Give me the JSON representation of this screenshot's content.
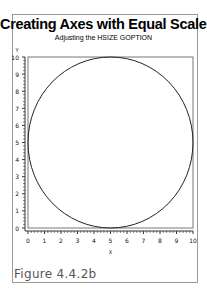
{
  "title": "Creating Axes with Equal Scales",
  "subtitle": "Adjusting the HSIZE GOPTION",
  "caption": "Figure 4.4.2b",
  "chart_data": {
    "type": "line",
    "title": "Creating Axes with Equal Scales",
    "subtitle": "Adjusting the HSIZE GOPTION",
    "xlabel": "X",
    "ylabel": "Y",
    "xlim": [
      0,
      10
    ],
    "ylim": [
      0,
      10
    ],
    "xticks": [
      0,
      1,
      2,
      3,
      4,
      5,
      6,
      7,
      8,
      9,
      10
    ],
    "yticks": [
      0,
      1,
      2,
      3,
      4,
      5,
      6,
      7,
      8,
      9,
      10
    ],
    "grid": false,
    "legend": null,
    "series": [
      {
        "name": "circle",
        "shape": "circle",
        "center": [
          5,
          5
        ],
        "radius": 5
      }
    ]
  },
  "colors": {
    "axis": "#333333",
    "curve": "#222222",
    "frame": "#9a9a9a",
    "caption": "#555555"
  }
}
